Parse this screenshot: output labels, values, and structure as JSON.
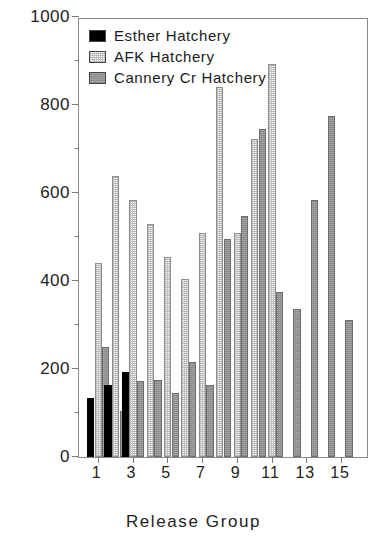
{
  "chart_data": {
    "type": "bar",
    "title": "",
    "xlabel": "Release Group",
    "ylabel": "Total/Marked Ratio",
    "ylim": [
      0,
      1000
    ],
    "yticks": [
      0,
      200,
      400,
      600,
      800,
      1000
    ],
    "yminorticks": [
      100,
      300,
      500,
      700,
      900
    ],
    "xticklabels": [
      "1",
      "3",
      "5",
      "7",
      "9",
      "11",
      "13",
      "15"
    ],
    "xtickgroups": [
      1,
      3,
      5,
      7,
      9,
      11,
      13,
      15
    ],
    "grid": false,
    "legend_position": "top-left",
    "categories": [
      "1",
      "2",
      "3",
      "4",
      "5",
      "6",
      "7",
      "8",
      "9",
      "10",
      "11",
      "12",
      "13",
      "14",
      "15",
      "16"
    ],
    "series": [
      {
        "name": "Esther Hatchery",
        "color": "#000000",
        "pattern": "solid-black",
        "values": [
          134,
          164,
          194,
          null,
          null,
          null,
          null,
          null,
          null,
          null,
          null,
          null,
          null,
          null,
          null,
          null
        ]
      },
      {
        "name": "AFK Hatchery",
        "color": "#fbfbfb",
        "pattern": "fine-dotted-light",
        "values": [
          440,
          638,
          584,
          530,
          455,
          405,
          508,
          null,
          840,
          508,
          722,
          893,
          null,
          null,
          null,
          null
        ]
      },
      {
        "name": "Cannery Cr Hatchery",
        "color": "#9a9a9a",
        "pattern": "fine-dotted-gray",
        "values": [
          250,
          104,
          172,
          176,
          145,
          215,
          164,
          null,
          495,
          547,
          745,
          374,
          336,
          583,
          775,
          312
        ]
      }
    ],
    "bars": [
      {
        "group": 1,
        "series": "Esther Hatchery",
        "value": 134
      },
      {
        "group": 1,
        "series": "AFK Hatchery",
        "value": 440
      },
      {
        "group": 1,
        "series": "Cannery Cr Hatchery",
        "value": 250
      },
      {
        "group": 2,
        "series": "Esther Hatchery",
        "value": 164
      },
      {
        "group": 2,
        "series": "AFK Hatchery",
        "value": 638
      },
      {
        "group": 2,
        "series": "Cannery Cr Hatchery",
        "value": 104
      },
      {
        "group": 3,
        "series": "Esther Hatchery",
        "value": 194
      },
      {
        "group": 3,
        "series": "AFK Hatchery",
        "value": 584
      },
      {
        "group": 3,
        "series": "Cannery Cr Hatchery",
        "value": 172
      },
      {
        "group": 4,
        "series": "AFK Hatchery",
        "value": 530
      },
      {
        "group": 4,
        "series": "Cannery Cr Hatchery",
        "value": 176
      },
      {
        "group": 5,
        "series": "AFK Hatchery",
        "value": 455
      },
      {
        "group": 5,
        "series": "Cannery Cr Hatchery",
        "value": 145
      },
      {
        "group": 6,
        "series": "AFK Hatchery",
        "value": 405
      },
      {
        "group": 6,
        "series": "Cannery Cr Hatchery",
        "value": 215
      },
      {
        "group": 7,
        "series": "AFK Hatchery",
        "value": 508
      },
      {
        "group": 7,
        "series": "Cannery Cr Hatchery",
        "value": 164
      },
      {
        "group": 8,
        "series": "AFK Hatchery",
        "value": 840
      },
      {
        "group": 8,
        "series": "Cannery Cr Hatchery",
        "value": 495
      },
      {
        "group": 9,
        "series": "AFK Hatchery",
        "value": 508
      },
      {
        "group": 9,
        "series": "Cannery Cr Hatchery",
        "value": 547
      },
      {
        "group": 10,
        "series": "AFK Hatchery",
        "value": 722
      },
      {
        "group": 10,
        "series": "Cannery Cr Hatchery",
        "value": 745
      },
      {
        "group": 11,
        "series": "AFK Hatchery",
        "value": 893
      },
      {
        "group": 11,
        "series": "Cannery Cr Hatchery",
        "value": 374
      },
      {
        "group": 12,
        "series": "Cannery Cr Hatchery",
        "value": 336
      },
      {
        "group": 13,
        "series": "Cannery Cr Hatchery",
        "value": 583
      },
      {
        "group": 14,
        "series": "Cannery Cr Hatchery",
        "value": 775
      },
      {
        "group": 15,
        "series": "Cannery Cr Hatchery",
        "value": 312
      }
    ]
  },
  "legend": {
    "items": [
      {
        "label": "Esther Hatchery",
        "swatch": "solid-black"
      },
      {
        "label": "AFK Hatchery",
        "swatch": "fine-dotted-light"
      },
      {
        "label": "Cannery Cr Hatchery",
        "swatch": "fine-dotted-gray"
      }
    ]
  }
}
